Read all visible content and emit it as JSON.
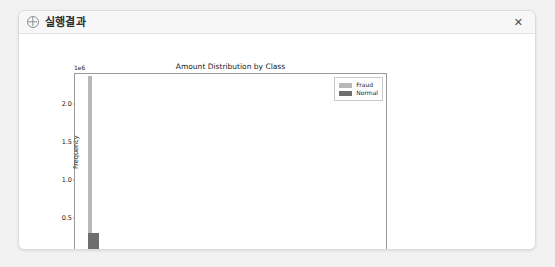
{
  "window": {
    "title": "실행결과",
    "icon": "compass-circle-icon",
    "close_label": "✕"
  },
  "chart_data": {
    "type": "bar",
    "title": "Amount Distribution by Class",
    "xlabel": "Transaction Amount",
    "ylabel": "Frequency",
    "y_exponent_label": "1e6",
    "xlim": [
      -1200,
      27500
    ],
    "ylim": [
      0,
      2400000
    ],
    "xticks": [
      0,
      5000,
      10000,
      15000,
      20000,
      25000
    ],
    "xtick_labels": [
      "0",
      "5000",
      "10000",
      "15000",
      "20000",
      "25000"
    ],
    "yticks": [
      0,
      500000,
      1000000,
      1500000,
      2000000
    ],
    "ytick_labels": [
      "0.0",
      "0.5",
      "1.0",
      "1.5",
      "2.0"
    ],
    "grid": false,
    "legend_position": "upper right",
    "series": [
      {
        "name": "Fraud",
        "color": "#b8b8b8",
        "bars": [
          {
            "x_start": 0,
            "x_end": 180,
            "value": 2320000
          }
        ]
      },
      {
        "name": "Normal",
        "color": "#6e6e6e",
        "bars": [
          {
            "x_start": 0,
            "x_end": 820,
            "value": 255000
          }
        ]
      }
    ]
  }
}
